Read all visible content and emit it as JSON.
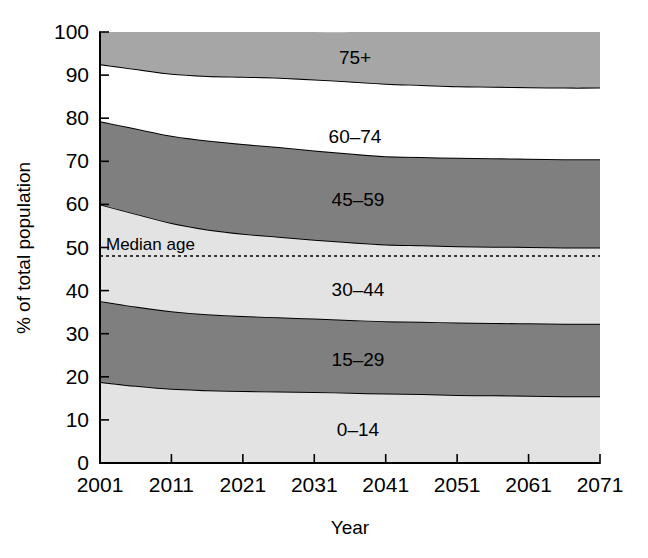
{
  "chart_data": {
    "type": "area",
    "title": "",
    "subtitle": "",
    "xlabel": "Year",
    "ylabel": "% of total population",
    "xlim": [
      2001,
      2071
    ],
    "ylim": [
      0,
      100
    ],
    "grid": false,
    "legend_position": "inline-band-labels",
    "stacked": true,
    "stack_order_bottom_to_top": [
      "0-14",
      "15-29",
      "30-44",
      "45-59",
      "60-74",
      "75+"
    ],
    "x": [
      2001,
      2006,
      2011,
      2016,
      2021,
      2026,
      2031,
      2036,
      2041,
      2046,
      2051,
      2056,
      2061,
      2066,
      2071
    ],
    "xticks": [
      2001,
      2011,
      2021,
      2031,
      2041,
      2051,
      2061,
      2071
    ],
    "xticklabels": [
      "2001",
      "2011",
      "2021",
      "2031",
      "2041",
      "2051",
      "2061",
      "2071"
    ],
    "yticks": [
      0,
      10,
      20,
      30,
      40,
      50,
      60,
      70,
      80,
      90,
      100
    ],
    "yticklabels": [
      "0",
      "10",
      "20",
      "30",
      "40",
      "50",
      "60",
      "70",
      "80",
      "90",
      "100"
    ],
    "series": [
      {
        "name": "0-14",
        "label": "0–14",
        "color": "#e3e3e3",
        "values": [
          18.8,
          17.9,
          17.2,
          16.9,
          16.7,
          16.6,
          16.5,
          16.3,
          16.1,
          16.0,
          15.8,
          15.7,
          15.6,
          15.5,
          15.5
        ]
      },
      {
        "name": "15-29",
        "label": "15–29",
        "color": "#7f7f7f",
        "values": [
          18.8,
          18.4,
          18.0,
          17.6,
          17.4,
          17.2,
          17.0,
          16.9,
          16.8,
          16.8,
          16.8,
          16.8,
          16.8,
          16.8,
          16.8
        ]
      },
      {
        "name": "30-44",
        "label": "30–44",
        "color": "#e3e3e3",
        "values": [
          22.4,
          21.5,
          20.5,
          19.7,
          19.1,
          18.7,
          18.3,
          18.0,
          17.8,
          17.7,
          17.7,
          17.7,
          17.7,
          17.7,
          17.7
        ]
      },
      {
        "name": "45-59",
        "label": "45–59",
        "color": "#7f7f7f",
        "values": [
          19.3,
          19.8,
          20.2,
          20.6,
          20.8,
          20.8,
          20.7,
          20.6,
          20.5,
          20.5,
          20.5,
          20.5,
          20.5,
          20.5,
          20.5
        ]
      },
      {
        "name": "60-74",
        "label": "60–74",
        "color": "#ffffff",
        "values": [
          13.2,
          13.8,
          14.4,
          15.0,
          15.6,
          16.1,
          16.5,
          16.7,
          16.8,
          16.7,
          16.6,
          16.6,
          16.6,
          16.6,
          16.6
        ]
      },
      {
        "name": "75+",
        "label": "75+",
        "color": "#a6a6a6",
        "values": [
          7.5,
          8.6,
          9.7,
          10.2,
          10.4,
          10.6,
          11.0,
          11.5,
          13.1,
          14.3,
          14.0,
          13.6,
          13.3,
          13.0,
          12.9
        ]
      }
    ],
    "annotations": [
      {
        "name": "median-age",
        "label": "Median age",
        "type": "horizontal-dashed-line",
        "y": 50,
        "color": "#000000"
      }
    ]
  },
  "axes": {
    "x_title": "Year",
    "y_title": "% of total population"
  },
  "band_labels": {
    "b75plus": "75+",
    "b60_74": "60–74",
    "b45_59": "45–59",
    "b30_44": "30–44",
    "b15_29": "15–29",
    "b0_14": "0–14"
  },
  "y_ticks": [
    "100",
    "90",
    "80",
    "70",
    "60",
    "50",
    "40",
    "30",
    "20",
    "10",
    "0"
  ],
  "x_ticks": [
    "2001",
    "2011",
    "2021",
    "2031",
    "2041",
    "2051",
    "2061",
    "2071"
  ],
  "median": {
    "label": "Median age"
  },
  "colors": {
    "light_band": "#e3e3e3",
    "dark_band": "#7f7f7f",
    "top_band": "#a6a6a6",
    "white_band": "#ffffff",
    "outline": "#000000"
  }
}
